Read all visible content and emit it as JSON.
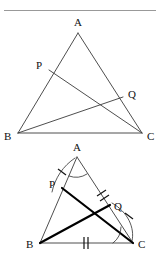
{
  "page": {
    "width": 161,
    "height": 265,
    "background": "#ffffff",
    "ink": "#1a1a1a"
  },
  "header": {
    "cropped_text": "",
    "note": "top line of text is cut off by the crop and unreadable"
  },
  "figures": [
    {
      "id": "figure-top",
      "name": "triangle-abc-with-cevians-plain",
      "labels": {
        "A": "A",
        "B": "B",
        "C": "C",
        "P": "P",
        "Q": "Q"
      },
      "points": {
        "A": [
          78,
          21
        ],
        "B": [
          18,
          121
        ],
        "C": [
          142,
          121
        ],
        "P": [
          49,
          58
        ],
        "Q": [
          123,
          85
        ]
      },
      "label_offsets": {
        "A": [
          -4,
          -4
        ],
        "B": [
          -11,
          9
        ],
        "C": [
          5,
          9
        ],
        "P": [
          -11,
          1
        ],
        "Q": [
          5,
          -2
        ]
      },
      "segments": [
        {
          "name": "side-AB",
          "from": "A",
          "to": "B",
          "weight": "thin"
        },
        {
          "name": "side-AC",
          "from": "A",
          "to": "C",
          "weight": "thin"
        },
        {
          "name": "side-BC",
          "from": "B",
          "to": "C",
          "weight": "thin"
        },
        {
          "name": "cevian-PC",
          "from": "P",
          "to": "C",
          "weight": "thin"
        },
        {
          "name": "cevian-BQ",
          "from": "B",
          "to": "Q",
          "weight": "thin"
        }
      ],
      "arcs": [],
      "ticks": []
    },
    {
      "id": "figure-bottom",
      "name": "triangle-abc-with-cevians-marked",
      "labels": {
        "A": "A",
        "B": "B",
        "C": "C",
        "P": "P",
        "Q": "Q"
      },
      "points": {
        "A": [
          77,
          17
        ],
        "B": [
          40,
          103
        ],
        "C": [
          133,
          103
        ],
        "P": [
          62,
          48
        ],
        "Q": [
          110,
          65
        ]
      },
      "label_offsets": {
        "A": [
          -4,
          -4
        ],
        "B": [
          -11,
          5
        ],
        "C": [
          5,
          5
        ],
        "P": [
          -11,
          1
        ],
        "Q": [
          5,
          2
        ]
      },
      "segments": [
        {
          "name": "side-AB",
          "from": "A",
          "to": "B",
          "weight": "thin"
        },
        {
          "name": "side-AC",
          "from": "A",
          "to": "C",
          "weight": "thin"
        },
        {
          "name": "side-BC",
          "from": "B",
          "to": "C",
          "weight": "thin"
        },
        {
          "name": "cevian-PC",
          "from": "P",
          "to": "C",
          "weight": "bold"
        },
        {
          "name": "cevian-BQ",
          "from": "B",
          "to": "Q",
          "weight": "bold"
        }
      ],
      "arcs": [
        {
          "name": "angle-arc-at-A",
          "at": "A"
        },
        {
          "name": "congruence-arc-AP-to-C",
          "at": "A-P-side"
        },
        {
          "name": "angle-arc-at-C",
          "at": "C"
        },
        {
          "name": "congruence-arc-Q-to-C",
          "at": "Q-C-side"
        }
      ],
      "ticks": [
        {
          "name": "tick-single-on-AP",
          "segment": "AP",
          "count": 1
        },
        {
          "name": "tick-double-on-AQ",
          "segment": "AQ",
          "count": 2
        },
        {
          "name": "tick-double-on-BC",
          "segment": "BC",
          "count": 2
        },
        {
          "name": "tick-single-on-CQ-arc",
          "segment": "CQ-arc",
          "count": 1
        }
      ]
    }
  ]
}
